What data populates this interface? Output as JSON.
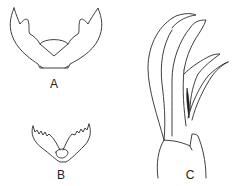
{
  "figure": {
    "panels": [
      {
        "id": "A",
        "label": "A",
        "description": "symmetrical U-shaped structure with two bifurcated upper lobes and a rounded central plate"
      },
      {
        "id": "B",
        "label": "B",
        "description": "V-shaped structure with serrated (toothed) inner margins"
      },
      {
        "id": "C",
        "label": "C",
        "description": "side view of elongated curved blade-like appendages rising from a basal segment"
      }
    ],
    "line_color": "#2a2a2a",
    "background": "#ffffff"
  }
}
